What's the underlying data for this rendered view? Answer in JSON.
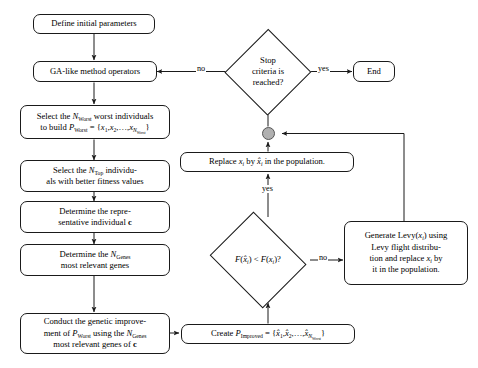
{
  "diagram": {
    "type": "flowchart",
    "colors": {
      "stroke": "#1a1a1a",
      "node_fill": "#ffffff",
      "merge_fill": "#b0b0b0",
      "merge_stroke": "#555555",
      "text": "#000000"
    }
  },
  "nodes": {
    "define_params": "Define initial parameters",
    "ga_operators": "GA-like method operators",
    "select_worst_line1": "Select the N_Worst worst individuals",
    "select_worst_line2": "to build P_Worst = {x1, x2, ..., xN_Worst}",
    "select_top_line1": "Select the N_Top individu-",
    "select_top_line2": "als with better fitness values",
    "determine_rep_line1": "Determine the repre-",
    "determine_rep_line2": "sentative individual c",
    "determine_genes_line1": "Determine the N_Genes",
    "determine_genes_line2": "most relevant genes",
    "conduct_line1": "Conduct the genetic improve-",
    "conduct_line2": "ment of P_Worst using the N_Genes",
    "conduct_line3": "most relevant genes of c",
    "create_improved": "Create P_Improved = {x̂1, x̂2, ..., x̂N_Worst}",
    "replace": "Replace xi by x̂i in the population.",
    "levy_line1": "Generate Levy(xi) using",
    "levy_line2": "Levy flight distribu-",
    "levy_line3": "tion and replace xi by",
    "levy_line4": "it in the population.",
    "end": "End"
  },
  "decisions": {
    "stop_criteria_line1": "Stop",
    "stop_criteria_line2": "criteria is",
    "stop_criteria_line3": "reached?",
    "fitness_compare": "F(x̂i) < F(xi)?"
  },
  "edge_labels": {
    "stop_no": "no",
    "stop_yes": "yes",
    "fitness_yes": "yes",
    "fitness_no": "no"
  },
  "merge_node": {
    "name": "merge-junction"
  }
}
